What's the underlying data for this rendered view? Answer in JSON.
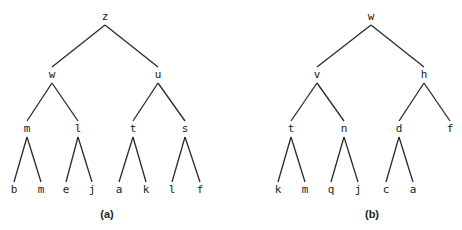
{
  "figures": [
    {
      "caption": "(a)",
      "caption_pos": [
        107,
        218
      ],
      "nodes": [
        {
          "id": "a0",
          "label": "z",
          "x": 105,
          "y": 20
        },
        {
          "id": "a1",
          "label": "w",
          "x": 52,
          "y": 78
        },
        {
          "id": "a2",
          "label": "u",
          "x": 158,
          "y": 78
        },
        {
          "id": "a3",
          "label": "m",
          "x": 27,
          "y": 132
        },
        {
          "id": "a4",
          "label": "l",
          "x": 78,
          "y": 132
        },
        {
          "id": "a5",
          "label": "t",
          "x": 133,
          "y": 132
        },
        {
          "id": "a6",
          "label": "s",
          "x": 185,
          "y": 132
        },
        {
          "id": "a7",
          "label": "b",
          "x": 14,
          "y": 193
        },
        {
          "id": "a8",
          "label": "m",
          "x": 41,
          "y": 193
        },
        {
          "id": "a9",
          "label": "e",
          "x": 66,
          "y": 193
        },
        {
          "id": "a10",
          "label": "j",
          "x": 92,
          "y": 193
        },
        {
          "id": "a11",
          "label": "a",
          "x": 119,
          "y": 193
        },
        {
          "id": "a12",
          "label": "k",
          "x": 146,
          "y": 193
        },
        {
          "id": "a13",
          "label": "l",
          "x": 172,
          "y": 193
        },
        {
          "id": "a14",
          "label": "f",
          "x": 200,
          "y": 193
        }
      ],
      "edges": [
        [
          "a0",
          "a1"
        ],
        [
          "a0",
          "a2"
        ],
        [
          "a1",
          "a3"
        ],
        [
          "a1",
          "a4"
        ],
        [
          "a2",
          "a5"
        ],
        [
          "a2",
          "a6"
        ],
        [
          "a3",
          "a7"
        ],
        [
          "a3",
          "a8"
        ],
        [
          "a4",
          "a9"
        ],
        [
          "a4",
          "a10"
        ],
        [
          "a5",
          "a11"
        ],
        [
          "a5",
          "a12"
        ],
        [
          "a6",
          "a13"
        ],
        [
          "a6",
          "a14"
        ]
      ]
    },
    {
      "caption": "(b)",
      "caption_pos": [
        372,
        218
      ],
      "nodes": [
        {
          "id": "b0",
          "label": "w",
          "x": 371,
          "y": 20
        },
        {
          "id": "b1",
          "label": "v",
          "x": 317,
          "y": 78
        },
        {
          "id": "b2",
          "label": "h",
          "x": 424,
          "y": 78
        },
        {
          "id": "b3",
          "label": "t",
          "x": 291,
          "y": 132
        },
        {
          "id": "b4",
          "label": "n",
          "x": 344,
          "y": 132
        },
        {
          "id": "b5",
          "label": "d",
          "x": 399,
          "y": 132
        },
        {
          "id": "b6",
          "label": "f",
          "x": 450,
          "y": 132
        },
        {
          "id": "b7",
          "label": "k",
          "x": 278,
          "y": 193
        },
        {
          "id": "b8",
          "label": "m",
          "x": 305,
          "y": 193
        },
        {
          "id": "b9",
          "label": "q",
          "x": 331,
          "y": 193
        },
        {
          "id": "b10",
          "label": "j",
          "x": 358,
          "y": 193
        },
        {
          "id": "b11",
          "label": "c",
          "x": 386,
          "y": 193
        },
        {
          "id": "b12",
          "label": "a",
          "x": 413,
          "y": 193
        }
      ],
      "edges": [
        [
          "b0",
          "b1"
        ],
        [
          "b0",
          "b2"
        ],
        [
          "b1",
          "b3"
        ],
        [
          "b1",
          "b4"
        ],
        [
          "b2",
          "b5"
        ],
        [
          "b2",
          "b6"
        ],
        [
          "b3",
          "b7"
        ],
        [
          "b3",
          "b8"
        ],
        [
          "b4",
          "b9"
        ],
        [
          "b4",
          "b10"
        ],
        [
          "b5",
          "b11"
        ],
        [
          "b5",
          "b12"
        ]
      ]
    }
  ]
}
